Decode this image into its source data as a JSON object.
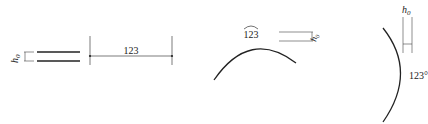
{
  "figures": [
    {
      "id": "linear",
      "description": "linear dimension with text height h0",
      "text_height_label": "h",
      "text_height_sub": "0",
      "dimension_value": "123"
    },
    {
      "id": "arc",
      "description": "arc length dimension",
      "dimension_value": "123",
      "text_height_label": "h",
      "text_height_sub": "0"
    },
    {
      "id": "angular",
      "description": "angular dimension",
      "text_height_label": "h",
      "text_height_sub": "0",
      "dimension_value": "123°"
    }
  ],
  "colors": {
    "line": "#222222",
    "thin_line": "#444444",
    "background": "#ffffff"
  }
}
